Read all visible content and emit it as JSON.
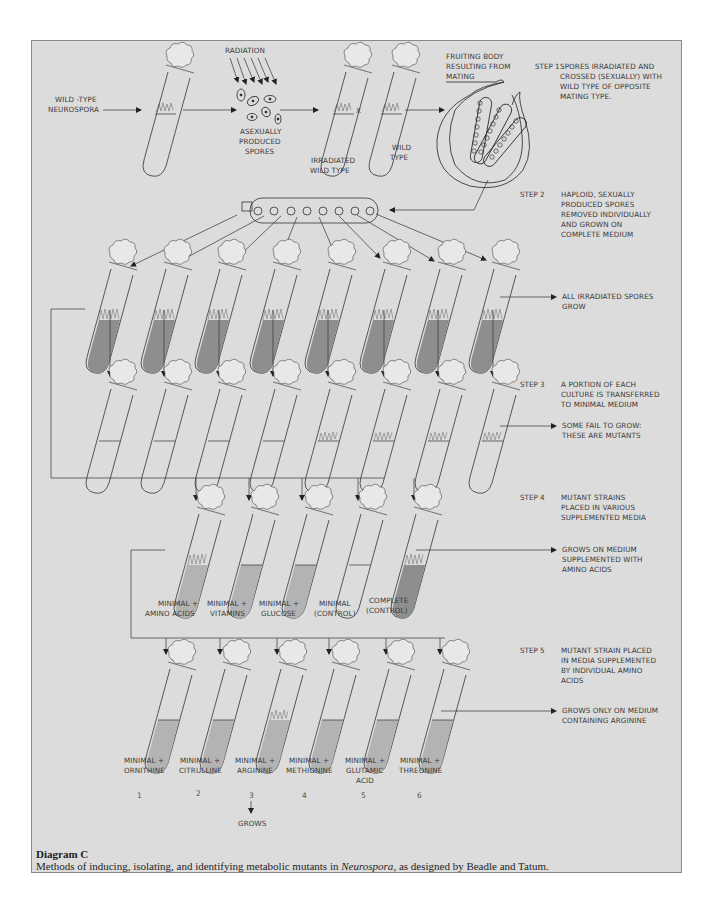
{
  "page": {
    "header_mark": "pp"
  },
  "top_row": {
    "wild_type_label": [
      "WILD -TYPE",
      "NEUROSPORA"
    ],
    "radiation_label": "RADIATION",
    "spores_label": [
      "ASEXUALLY",
      "PRODUCED",
      "SPORES"
    ],
    "irradiated_label": [
      "IRRADIATED",
      "WILD TYPE"
    ],
    "cross_symbol": "X",
    "wild_type_tube_label": [
      "WILD",
      "TYPE"
    ],
    "fruiting_body_label": [
      "FRUITING BODY",
      "RESULTING FROM",
      "MATING"
    ]
  },
  "steps": [
    {
      "label": "STEP 1",
      "description": [
        "SPORES IRRADIATED AND",
        "CROSSED (SEXUALLY) WITH",
        "WILD TYPE OF OPPOSITE",
        "MATING TYPE."
      ]
    },
    {
      "label": "STEP 2",
      "description": [
        "HAPLOID, SEXUALLY",
        "PRODUCED SPORES",
        "REMOVED INDIVIDUALLY",
        "AND GROWN ON",
        "COMPLETE MEDIUM"
      ],
      "result": [
        "ALL IRRADIATED SPORES",
        "GROW"
      ]
    },
    {
      "label": "STEP 3",
      "description": [
        "A PORTION OF EACH",
        "CULTURE IS TRANSFERRED",
        "TO MINIMAL MEDIUM"
      ],
      "result": [
        "SOME FAIL TO GROW:",
        "THESE ARE MUTANTS"
      ]
    },
    {
      "label": "STEP 4",
      "description": [
        "MUTANT STRAINS",
        "PLACED IN VARIOUS",
        "SUPPLEMENTED MEDIA"
      ],
      "result": [
        "GROWS ON MEDIUM",
        "SUPPLEMENTED WITH",
        "AMINO ACIDS"
      ]
    },
    {
      "label": "STEP 5",
      "description": [
        "MUTANT STRAIN PLACED",
        "IN MEDIA SUPPLEMENTED",
        "BY INDIVIDUAL AMINO",
        "ACIDS"
      ],
      "result": [
        "GROWS ONLY ON MEDIUM",
        "CONTAINING ARGININE"
      ]
    }
  ],
  "step4_media": [
    {
      "label": [
        "MINIMAL +",
        "AMINO ACIDS"
      ],
      "growth": true
    },
    {
      "label": [
        "MINIMAL +",
        "VITAMINS"
      ],
      "growth": false
    },
    {
      "label": [
        "MINIMAL +",
        "GLUCOSE"
      ],
      "growth": false
    },
    {
      "label": [
        "MINIMAL",
        "(CONTROL)"
      ],
      "growth": false
    },
    {
      "label": [
        "COMPLETE",
        "(CONTROL)"
      ],
      "growth": true
    }
  ],
  "step5_media": [
    {
      "label": [
        "MINIMAL +",
        "ORNITHINE"
      ],
      "number": "1",
      "growth": false
    },
    {
      "label": [
        "MINIMAL +",
        "CITRULLINE"
      ],
      "number": "2",
      "growth": false
    },
    {
      "label": [
        "MINIMAL +",
        "ARGININE"
      ],
      "number": "3",
      "growth": true
    },
    {
      "label": [
        "MINIMAL +",
        "METHIONINE"
      ],
      "number": "4",
      "growth": false
    },
    {
      "label": [
        "MINIMAL +",
        "GLUTAMIC",
        "ACID"
      ],
      "number": "5",
      "growth": false
    },
    {
      "label": [
        "MINIMAL +",
        "THREONINE"
      ],
      "number": "6",
      "growth": false
    }
  ],
  "step3_growth": [
    false,
    false,
    false,
    false,
    true,
    true,
    true,
    true
  ],
  "grows_label": "GROWS",
  "caption": {
    "title": "Diagram C",
    "text_before": "Methods of inducing, isolating, and identifying metabolic mutants in ",
    "text_italic": "Neurospora",
    "text_after": ", as designed by Beadle and Tatum."
  },
  "colors": {
    "panel_bg": "#dcdcdc",
    "medium_complete": "#8e8e8e",
    "medium_supplemented": "#b3b3b3",
    "line": "#333333"
  }
}
